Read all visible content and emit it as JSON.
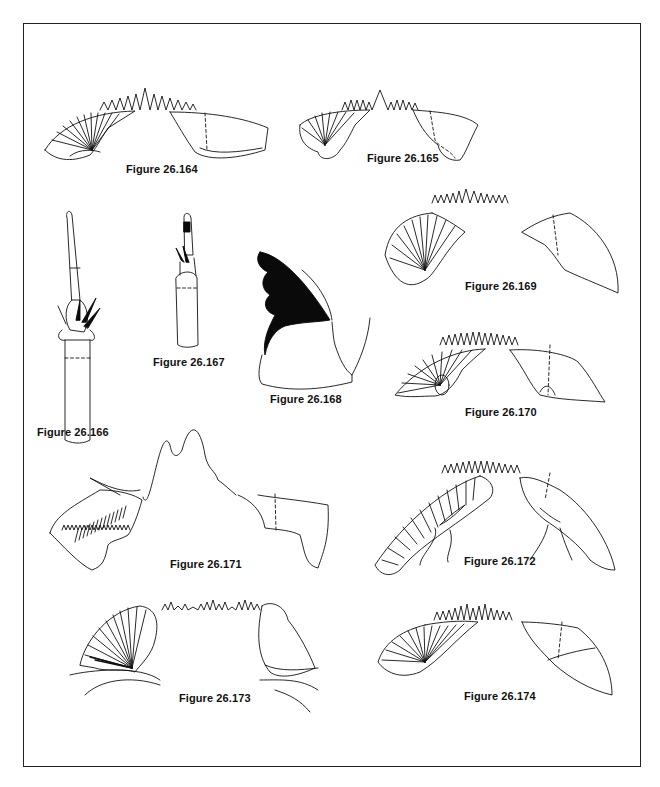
{
  "plate": {
    "figures": [
      {
        "id": "fig-164",
        "label": "Figure 26.164"
      },
      {
        "id": "fig-165",
        "label": "Figure 26.165"
      },
      {
        "id": "fig-166",
        "label": "Figure 26.166"
      },
      {
        "id": "fig-167",
        "label": "Figure 26.167"
      },
      {
        "id": "fig-168",
        "label": "Figure 26.168"
      },
      {
        "id": "fig-169",
        "label": "Figure 26.169"
      },
      {
        "id": "fig-170",
        "label": "Figure 26.170"
      },
      {
        "id": "fig-171",
        "label": "Figure 26.171"
      },
      {
        "id": "fig-172",
        "label": "Figure 26.172"
      },
      {
        "id": "fig-173",
        "label": "Figure 26.173"
      },
      {
        "id": "fig-174",
        "label": "Figure 26.174"
      }
    ]
  }
}
